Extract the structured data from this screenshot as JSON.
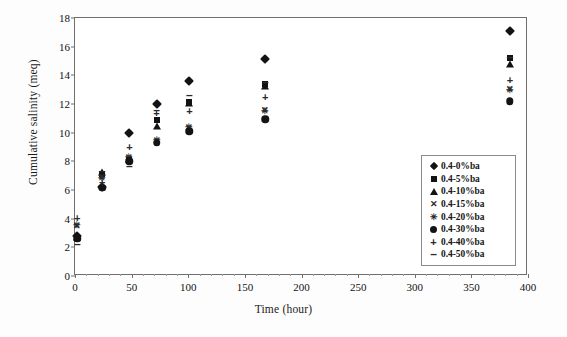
{
  "chart_data": {
    "type": "scatter",
    "title": "",
    "xlabel": "Time (hour)",
    "ylabel": "Cumulative salinity (meq)",
    "xlim": [
      0,
      400
    ],
    "ylim": [
      0,
      18
    ],
    "xticks": [
      0,
      50,
      100,
      150,
      200,
      250,
      300,
      350,
      400
    ],
    "yticks": [
      0,
      2,
      4,
      6,
      8,
      10,
      12,
      14,
      16,
      18
    ],
    "grid": false,
    "legend_position": "inside-lower-right",
    "x": [
      2,
      24,
      48,
      72,
      101,
      168,
      384
    ],
    "series": [
      {
        "name": "0.4-0%ba",
        "marker": "diamond",
        "values": [
          2.8,
          6.2,
          9.95,
          12.0,
          13.6,
          15.15,
          17.1
        ]
      },
      {
        "name": "0.4-5%ba",
        "marker": "square",
        "values": [
          2.7,
          7.1,
          8.1,
          10.85,
          12.15,
          13.4,
          15.2
        ]
      },
      {
        "name": "0.4-10%ba",
        "marker": "triangle",
        "values": [
          2.75,
          7.25,
          8.15,
          10.5,
          12.1,
          13.25,
          14.8
        ]
      },
      {
        "name": "0.4-15%ba",
        "marker": "x",
        "values": [
          3.5,
          6.9,
          8.25,
          9.4,
          10.35,
          11.55,
          13.05
        ]
      },
      {
        "name": "0.4-20%ba",
        "marker": "star",
        "values": [
          3.55,
          6.85,
          8.3,
          9.5,
          10.4,
          11.5,
          13.0
        ]
      },
      {
        "name": "0.4-30%ba",
        "marker": "circle",
        "values": [
          2.6,
          6.15,
          8.0,
          9.3,
          10.1,
          10.95,
          12.2
        ]
      },
      {
        "name": "0.4-40%ba",
        "marker": "plus",
        "values": [
          4.05,
          6.55,
          9.0,
          11.4,
          11.5,
          12.5,
          13.7
        ]
      },
      {
        "name": "0.4-50%ba",
        "marker": "dash",
        "values": [
          2.2,
          7.35,
          7.7,
          11.6,
          12.6,
          13.55,
          15.25
        ]
      }
    ]
  },
  "legend": {
    "items": [
      {
        "label": "0.4-0%ba",
        "marker": "diamond"
      },
      {
        "label": "0.4-5%ba",
        "marker": "square"
      },
      {
        "label": "0.4-10%ba",
        "marker": "triangle"
      },
      {
        "label": "0.4-15%ba",
        "marker": "x"
      },
      {
        "label": "0.4-20%ba",
        "marker": "star"
      },
      {
        "label": "0.4-30%ba",
        "marker": "circle"
      },
      {
        "label": "0.4-40%ba",
        "marker": "plus"
      },
      {
        "label": "0.4-50%ba",
        "marker": "dash"
      }
    ]
  },
  "colors": {
    "marker": "#131313",
    "axis": "#6f6f6f",
    "background": "#ffffff"
  }
}
